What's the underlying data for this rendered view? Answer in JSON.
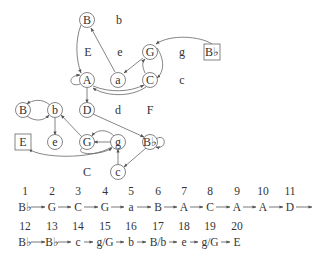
{
  "upper_graph": {
    "nodes": [
      {
        "id": "B",
        "label": "B",
        "x": 87,
        "y": 20,
        "shape": "circle"
      },
      {
        "id": "A",
        "label": "A",
        "x": 87,
        "y": 80,
        "shape": "circle"
      },
      {
        "id": "a",
        "label": "a",
        "x": 118,
        "y": 80,
        "shape": "circle"
      },
      {
        "id": "G",
        "label": "G",
        "x": 150,
        "y": 52,
        "shape": "circle"
      },
      {
        "id": "C",
        "label": "C",
        "x": 150,
        "y": 80,
        "shape": "circle"
      },
      {
        "id": "D",
        "label": "D",
        "x": 87,
        "y": 110,
        "shape": "circle"
      },
      {
        "id": "Bb",
        "label": "B♭",
        "x": 212,
        "y": 52,
        "shape": "box"
      }
    ],
    "free_labels": [
      {
        "label": "b",
        "x": 119,
        "y": 20
      },
      {
        "label": "E",
        "x": 88,
        "y": 52
      },
      {
        "label": "e",
        "x": 120,
        "y": 52
      },
      {
        "label": "g",
        "x": 182,
        "y": 52
      },
      {
        "label": "c",
        "x": 182,
        "y": 80
      },
      {
        "label": "d",
        "x": 118,
        "y": 110
      },
      {
        "label": "F",
        "x": 150,
        "y": 110
      }
    ]
  },
  "lower_graph": {
    "nodes": [
      {
        "id": "B2",
        "label": "B",
        "x": 23,
        "y": 110,
        "shape": "circle"
      },
      {
        "id": "b2",
        "label": "b",
        "x": 55,
        "y": 110,
        "shape": "circle"
      },
      {
        "id": "E2",
        "label": "E",
        "x": 23,
        "y": 142,
        "shape": "box"
      },
      {
        "id": "e2",
        "label": "e",
        "x": 55,
        "y": 142,
        "shape": "circle"
      },
      {
        "id": "G2",
        "label": "G",
        "x": 87,
        "y": 142,
        "shape": "circle"
      },
      {
        "id": "g2",
        "label": "g",
        "x": 118,
        "y": 142,
        "shape": "circle"
      },
      {
        "id": "Bb2",
        "label": "B♭",
        "x": 150,
        "y": 142,
        "shape": "circle"
      },
      {
        "id": "c2",
        "label": "c",
        "x": 118,
        "y": 172,
        "shape": "circle"
      }
    ],
    "free_labels": [
      {
        "label": "C",
        "x": 87,
        "y": 172
      }
    ]
  },
  "sequence": {
    "row1": {
      "numbers": [
        "1",
        "2",
        "3",
        "4",
        "5",
        "6",
        "7",
        "8",
        "9",
        "10",
        "11"
      ],
      "labels": [
        "B♭",
        "G",
        "C",
        "G",
        "a",
        "B",
        "A",
        "C",
        "A",
        "A",
        "D"
      ],
      "x": [
        25,
        52,
        78,
        105,
        131,
        158,
        184,
        210,
        237,
        263,
        290
      ]
    },
    "row2": {
      "numbers": [
        "12",
        "13",
        "14",
        "15",
        "16",
        "17",
        "18",
        "19",
        "20"
      ],
      "labels": [
        "B♭",
        "B♭",
        "c",
        "g/G",
        "b",
        "B/b",
        "e",
        "g/G",
        "E"
      ],
      "x": [
        25,
        52,
        78,
        105,
        131,
        158,
        184,
        210,
        237
      ]
    }
  }
}
